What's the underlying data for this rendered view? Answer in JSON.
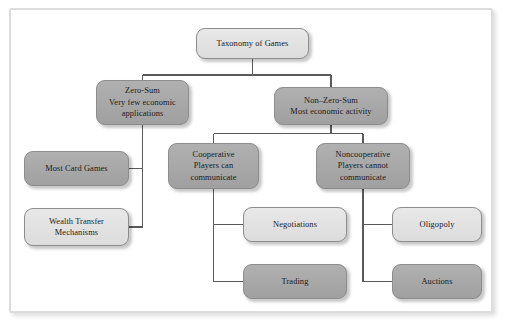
{
  "diagram": {
    "type": "tree",
    "title": "Taxonomy of Games",
    "nodes": [
      {
        "id": "root",
        "lines": [
          "Taxonomy of Games"
        ],
        "shade": "light",
        "x": 196,
        "y": 28,
        "w": 113,
        "h": 31
      },
      {
        "id": "zero-sum",
        "lines": [
          "Zero-Sum",
          "Very few economic",
          "applications"
        ],
        "shade": "dark",
        "x": 96,
        "y": 80,
        "w": 93,
        "h": 45
      },
      {
        "id": "non-zero-sum",
        "lines": [
          "Non–Zero-Sum",
          "Most economic activity"
        ],
        "shade": "dark",
        "x": 274,
        "y": 87,
        "w": 114,
        "h": 38
      },
      {
        "id": "cooperative",
        "lines": [
          "Cooperative",
          "Players can",
          "communicate"
        ],
        "shade": "dark",
        "x": 168,
        "y": 143,
        "w": 91,
        "h": 46
      },
      {
        "id": "noncooperative",
        "lines": [
          "Noncooperative",
          "Players cannot",
          "communicate"
        ],
        "shade": "dark",
        "x": 316,
        "y": 143,
        "w": 94,
        "h": 46
      },
      {
        "id": "most-card-games",
        "lines": [
          "Most Card Games"
        ],
        "shade": "dark",
        "x": 24,
        "y": 151,
        "w": 105,
        "h": 35
      },
      {
        "id": "wealth-transfer-mechanisms",
        "lines": [
          "Wealth Transfer",
          "Mechanisms"
        ],
        "shade": "light",
        "x": 24,
        "y": 208,
        "w": 105,
        "h": 38
      },
      {
        "id": "negotiations",
        "lines": [
          "Negotiations"
        ],
        "shade": "light",
        "x": 243,
        "y": 207,
        "w": 104,
        "h": 35
      },
      {
        "id": "trading",
        "lines": [
          "Trading"
        ],
        "shade": "dark",
        "x": 243,
        "y": 264,
        "w": 104,
        "h": 35
      },
      {
        "id": "oligopoly",
        "lines": [
          "Oligopoly"
        ],
        "shade": "light",
        "x": 392,
        "y": 207,
        "w": 90,
        "h": 35
      },
      {
        "id": "auctions",
        "lines": [
          "Auctions"
        ],
        "shade": "dark",
        "x": 392,
        "y": 264,
        "w": 90,
        "h": 35
      }
    ],
    "edges": [
      {
        "from": "root",
        "to": "zero-sum"
      },
      {
        "from": "root",
        "to": "non-zero-sum"
      },
      {
        "from": "non-zero-sum",
        "to": "cooperative"
      },
      {
        "from": "non-zero-sum",
        "to": "noncooperative"
      },
      {
        "from": "zero-sum",
        "to": "most-card-games"
      },
      {
        "from": "zero-sum",
        "to": "wealth-transfer-mechanisms"
      },
      {
        "from": "cooperative",
        "to": "negotiations"
      },
      {
        "from": "cooperative",
        "to": "trading"
      },
      {
        "from": "noncooperative",
        "to": "oligopoly"
      },
      {
        "from": "noncooperative",
        "to": "auctions"
      }
    ],
    "colors": {
      "line": "#5a5a5a",
      "node_light": "#e2e2e2",
      "node_dark": "#a8a8a8",
      "node_border": "#8d8d8d",
      "frame_border": "#dcdcdc",
      "background": "#ffffff",
      "text": "#1a1a1a"
    }
  }
}
